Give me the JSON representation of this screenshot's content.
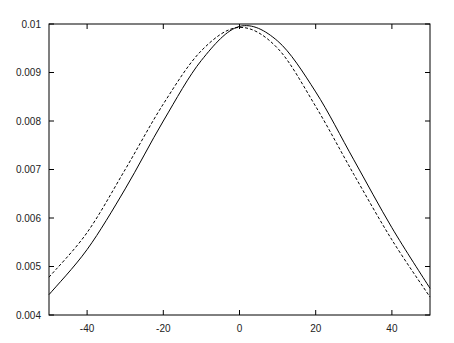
{
  "chart_data": {
    "type": "line",
    "title": "",
    "xlabel": "",
    "ylabel": "",
    "xlim": [
      -50,
      50
    ],
    "ylim": [
      0.004,
      0.01
    ],
    "grid": false,
    "legend": null,
    "x_ticks": [
      -40,
      -20,
      0,
      20,
      40
    ],
    "x_tick_labels": [
      "-40",
      "-20",
      "0",
      "20",
      "40"
    ],
    "y_ticks": [
      0.004,
      0.005,
      0.006,
      0.007,
      0.008,
      0.009,
      0.01
    ],
    "y_tick_labels": [
      "0.004",
      "0.005",
      "0.006",
      "0.007",
      "0.008",
      "0.009",
      "0.01"
    ],
    "series": [
      {
        "name": "solid",
        "style": "solid",
        "color": "#000000",
        "x": [
          -50,
          -40,
          -30,
          -20,
          -10,
          0,
          10,
          20,
          30,
          40,
          50
        ],
        "y": [
          0.00442,
          0.00535,
          0.0066,
          0.008,
          0.00925,
          0.00995,
          0.00965,
          0.0086,
          0.0072,
          0.0058,
          0.00455
        ]
      },
      {
        "name": "dashed",
        "style": "dashed",
        "color": "#000000",
        "x": [
          -50,
          -40,
          -30,
          -20,
          -10,
          0,
          10,
          20,
          30,
          40,
          50
        ],
        "y": [
          0.00478,
          0.0057,
          0.007,
          0.00835,
          0.00945,
          0.00993,
          0.0095,
          0.0083,
          0.0069,
          0.00555,
          0.00437
        ]
      }
    ]
  }
}
